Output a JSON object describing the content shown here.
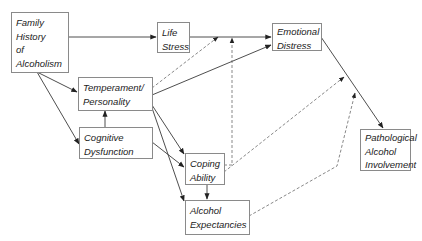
{
  "diagram": {
    "colors": {
      "line": "#3a3a3a",
      "dashed": "#6a6a6a",
      "box_border": "#8a8a8a",
      "text": "#222222",
      "background": "#ffffff"
    },
    "nodes": {
      "family_history": {
        "lines": [
          "Family",
          "History",
          "of",
          "Alcoholism"
        ]
      },
      "life_stress": {
        "lines": [
          "Life",
          "Stress"
        ]
      },
      "emotional_distress": {
        "lines": [
          "Emotional",
          "Distress"
        ]
      },
      "temperament": {
        "lines": [
          "Temperament/",
          "Personality"
        ]
      },
      "cognitive": {
        "lines": [
          "Cognitive",
          "Dysfunction"
        ]
      },
      "coping": {
        "lines": [
          "Coping",
          "Ability"
        ]
      },
      "expectancies": {
        "lines": [
          "Alcohol",
          "Expectancies"
        ]
      },
      "pathological": {
        "lines": [
          "Pathological",
          "Alcohol",
          "Involvement"
        ]
      }
    },
    "edges": [
      {
        "from": "family_history",
        "to": "life_stress",
        "style": "solid"
      },
      {
        "from": "family_history",
        "to": "temperament",
        "style": "solid"
      },
      {
        "from": "family_history",
        "to": "cognitive",
        "style": "solid"
      },
      {
        "from": "life_stress",
        "to": "emotional_distress",
        "style": "solid"
      },
      {
        "from": "temperament",
        "to": "emotional_distress",
        "style": "solid"
      },
      {
        "from": "temperament",
        "to": "life_stress->emotional_distress",
        "style": "dashed"
      },
      {
        "from": "cognitive",
        "to": "temperament",
        "style": "solid"
      },
      {
        "from": "temperament",
        "to": "coping",
        "style": "solid"
      },
      {
        "from": "temperament",
        "to": "expectancies",
        "style": "solid"
      },
      {
        "from": "cognitive",
        "to": "coping",
        "style": "solid"
      },
      {
        "from": "coping",
        "to": "expectancies",
        "style": "solid"
      },
      {
        "from": "coping",
        "to": "life_stress->emotional_distress",
        "style": "dashed"
      },
      {
        "from": "coping",
        "to": "emotional_distress->pathological",
        "style": "dashed"
      },
      {
        "from": "expectancies",
        "to": "emotional_distress->pathological",
        "style": "dashed"
      },
      {
        "from": "emotional_distress",
        "to": "pathological",
        "style": "solid"
      }
    ]
  }
}
